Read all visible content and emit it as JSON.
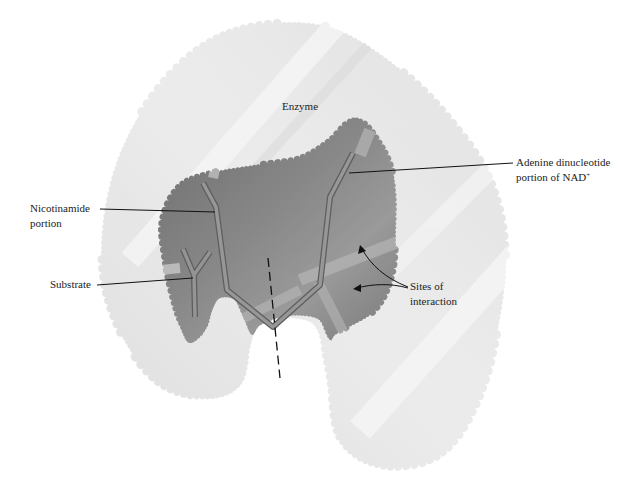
{
  "figure": {
    "colors": {
      "background": "#ffffff",
      "enzyme_fill": "#e6e6e6",
      "enzyme_highlight": "#f4f4f4",
      "cavity_fill": "#7d7d7d",
      "cavity_dark": "#666666",
      "molecule_stroke": "#8a8a8a",
      "molecule_edge": "#5a5a5a",
      "leader_line": "#111111",
      "label_text": "#222222"
    },
    "labels": {
      "enzyme": "Enzyme",
      "adenine_line1": "Adenine dinucleotide",
      "adenine_line2": "portion of NAD",
      "adenine_sup": "+",
      "nicotinamide_line1": "Nicotinamide",
      "nicotinamide_line2": "portion",
      "substrate": "Substrate",
      "sites_line1": "Sites of",
      "sites_line2": "interaction"
    }
  }
}
